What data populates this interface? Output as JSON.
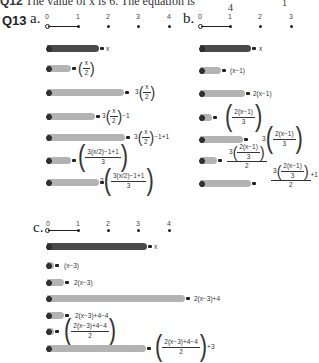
{
  "q12": {
    "label": "Q12",
    "text": "The value of x is 6. The equation is",
    "frac_den": "4",
    "trail": "1"
  },
  "q13": {
    "label": "Q13",
    "parts": [
      {
        "letter": "a.",
        "number_line": [
          "0",
          "1",
          "2",
          "3",
          "4"
        ],
        "rows": [
          {
            "label": "x"
          },
          {
            "label_frac_num": "x",
            "label_frac_den": "2"
          },
          {
            "label_prefix": "3",
            "label_frac_num": "x",
            "label_frac_den": "2"
          },
          {
            "label_prefix": "3",
            "label_frac_num": "x",
            "label_frac_den": "2",
            "label_suffix": "−1"
          },
          {
            "label_prefix": "3",
            "label_frac_num": "x",
            "label_frac_den": "2",
            "label_suffix": "−1+1"
          },
          {
            "label_num": "3(x/2)−1+1",
            "label_den": "3"
          },
          {
            "label_prefix": "2",
            "label_num": "3(x/2)−1+1",
            "label_den": "3"
          }
        ]
      },
      {
        "letter": "b.",
        "number_line": [
          "0",
          "1",
          "2",
          "3"
        ],
        "rows": [
          {
            "label": "x"
          },
          {
            "label": "(x−1)"
          },
          {
            "label": "2(x−1)"
          },
          {
            "label_num": "2(x−1)",
            "label_den": "3"
          },
          {
            "label_prefix": "3",
            "label_num": "2(x−1)",
            "label_den": "3"
          },
          {
            "label_prefix": "3",
            "label_num": "2(x−1)",
            "label_den_inner": "3",
            "label_outer_den": "2"
          },
          {
            "label_prefix": "3",
            "label_num": "2(x−1)",
            "label_den_inner": "3",
            "label_outer_den": "2",
            "label_suffix": "+1"
          }
        ]
      },
      {
        "letter": "c.",
        "number_line": [
          "0",
          "1",
          "2",
          "3",
          "4"
        ],
        "rows": [
          {
            "label": "x"
          },
          {
            "label": "(x−3)"
          },
          {
            "label": "2(x−3)"
          },
          {
            "label": "2(x−3)+4"
          },
          {
            "label": "2(x−3)+4−4"
          },
          {
            "label_num": "2(x−3)+4−4",
            "label_den": "2"
          },
          {
            "label_num": "2(x−3)+4−4",
            "label_den": "2",
            "label_suffix": "+3"
          }
        ]
      }
    ]
  },
  "colors": {
    "dark_bar": "#4a4a4a",
    "light_bar": "#b3b3b3",
    "text": "#222222"
  }
}
